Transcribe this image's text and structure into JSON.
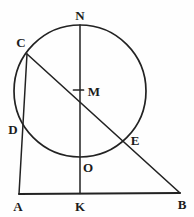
{
  "figure": {
    "background": "#fefefe",
    "ink_color": "#222222",
    "labels": {
      "N": "N",
      "C": "C",
      "M": "M",
      "D": "D",
      "E": "E",
      "O": "O",
      "A": "A",
      "K": "K",
      "B": "B"
    }
  }
}
